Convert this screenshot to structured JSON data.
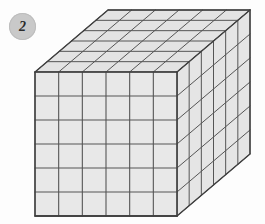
{
  "page": {
    "background_color": "#fdfdfd",
    "width": 265,
    "height": 224
  },
  "badge": {
    "label": "2",
    "shape": "circle",
    "fill_color": "#c9c9c9",
    "text_color": "#2b2b2b"
  },
  "figure": {
    "name": "unit-cube-block",
    "type": "isometric-cube-grid",
    "units_wide": 6,
    "units_high": 6,
    "units_deep": 6,
    "total_units": 216,
    "face_fill_front": "#e8e8e8",
    "face_fill_top": "#e3e3e3",
    "face_fill_right": "#e5e5e5",
    "line_color": "#555555",
    "outline_color": "#3f3f3f",
    "geometry": {
      "front_left_x": 35,
      "front_top_y": 72,
      "front_width": 142,
      "front_height": 144,
      "depth_dx": 73,
      "depth_dy": -62
    }
  }
}
